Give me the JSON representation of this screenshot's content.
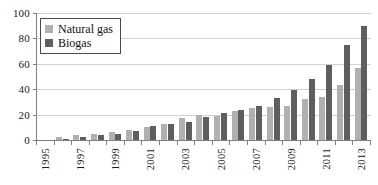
{
  "chart_data": {
    "type": "bar",
    "title": "",
    "xlabel": "",
    "ylabel": "",
    "ylim": [
      0,
      100
    ],
    "yticks": [
      0,
      20,
      40,
      60,
      80,
      100
    ],
    "grid": true,
    "legend_position": "upper-left",
    "categories": [
      "1995",
      "1996",
      "1997",
      "1998",
      "1999",
      "2000",
      "2001",
      "2002",
      "2003",
      "2004",
      "2005",
      "2006",
      "2007",
      "2008",
      "2009",
      "2010",
      "2011",
      "2012",
      "2013"
    ],
    "tick_labels": [
      "1995",
      "",
      "1997",
      "",
      "1999",
      "",
      "2001",
      "",
      "2003",
      "",
      "2005",
      "",
      "2007",
      "",
      "2009",
      "",
      "2011",
      "",
      "2013"
    ],
    "series": [
      {
        "name": "Natural gas",
        "color": "#b0b0b0",
        "values": [
          0,
          2,
          4,
          5,
          6,
          8,
          10,
          13,
          17,
          20,
          19,
          23,
          25,
          26,
          27,
          32,
          34,
          43,
          57
        ]
      },
      {
        "name": "Biogas",
        "color": "#5e5e5e",
        "values": [
          0,
          1,
          2,
          4,
          5,
          7,
          11,
          13,
          14,
          18,
          21,
          24,
          27,
          33,
          39,
          48,
          59,
          75,
          90
        ]
      }
    ]
  },
  "axes": {
    "y_tick_labels": [
      "100",
      "80",
      "60",
      "40",
      "20",
      "0"
    ]
  },
  "legend": {
    "items": [
      {
        "label": "Natural gas",
        "swatch_color": "#b0b0b0"
      },
      {
        "label": "Biogas",
        "swatch_color": "#5e5e5e"
      }
    ]
  }
}
